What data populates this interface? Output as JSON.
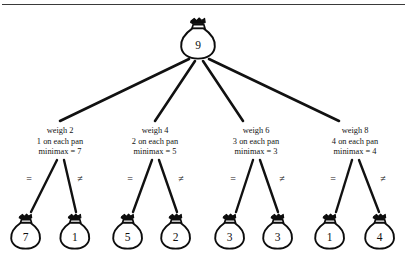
{
  "figure": {
    "type": "decision-tree-diagram",
    "title_rule": "horizontal-rule",
    "root": {
      "icon": "money-bag-icon",
      "value": "9"
    },
    "decision_nodes": [
      {
        "line1": "weigh 2",
        "line2": "1 on each pan",
        "line3": "minimax = 7",
        "edge_left": "=",
        "edge_right": "≠",
        "leaf_left": "7",
        "leaf_right": "1"
      },
      {
        "line1": "weigh 4",
        "line2": "2 on each pan",
        "line3": "minimax = 5",
        "edge_left": "=",
        "edge_right": "≠",
        "leaf_left": "5",
        "leaf_right": "2"
      },
      {
        "line1": "weigh 6",
        "line2": "3 on each pan",
        "line3": "minimax = 3",
        "edge_left": "=",
        "edge_right": "≠",
        "leaf_left": "3",
        "leaf_right": "3"
      },
      {
        "line1": "weigh 8",
        "line2": "4 on each pan",
        "line3": "minimax = 4",
        "edge_left": "=",
        "edge_right": "≠",
        "leaf_left": "1",
        "leaf_right": "4"
      }
    ],
    "colors": {
      "ink": "#0d0d0d",
      "background": "#ffffff",
      "rule": "#3a3a3a"
    }
  }
}
